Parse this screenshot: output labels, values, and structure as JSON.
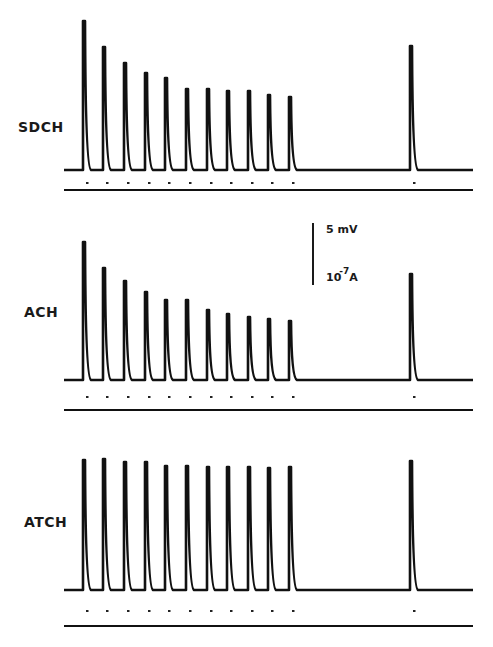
{
  "chart_data": {
    "type": "line",
    "title": "",
    "xlabel": "",
    "ylabel": "",
    "grid": false,
    "legend": "none",
    "scale_bar": {
      "voltage": "5 mV",
      "current_base": "10",
      "current_exp": "-7",
      "current_unit": "A"
    },
    "stimulus_x": [
      84,
      104,
      125,
      146,
      166,
      187,
      208,
      228,
      249,
      269,
      290
    ],
    "test_x": 411,
    "panels": [
      {
        "name": "SDCH",
        "baseline_y": 170,
        "marker_y": 182,
        "axis_y": 190,
        "spike_tops": [
          21,
          47,
          63,
          73,
          78,
          89,
          89,
          91,
          91,
          95,
          97
        ],
        "test_top": 46,
        "relative_amplitudes": [
          1.0,
          0.83,
          0.72,
          0.65,
          0.62,
          0.54,
          0.54,
          0.53,
          0.53,
          0.5,
          0.49
        ],
        "test_relative_amplitude": 0.83
      },
      {
        "name": "ACH",
        "baseline_y": 380,
        "marker_y": 396,
        "axis_y": 410,
        "spike_tops": [
          242,
          268,
          281,
          292,
          300,
          300,
          310,
          314,
          317,
          319,
          321
        ],
        "test_top": 274,
        "relative_amplitudes": [
          1.0,
          0.81,
          0.72,
          0.64,
          0.58,
          0.58,
          0.51,
          0.48,
          0.46,
          0.44,
          0.43
        ],
        "test_relative_amplitude": 0.77
      },
      {
        "name": "ATCH",
        "baseline_y": 590,
        "marker_y": 610,
        "axis_y": 626,
        "spike_tops": [
          460,
          459,
          462,
          462,
          466,
          466,
          467,
          467,
          467,
          468,
          467
        ],
        "test_top": 461,
        "relative_amplitudes": [
          1.0,
          1.01,
          0.98,
          0.98,
          0.95,
          0.95,
          0.95,
          0.95,
          0.95,
          0.94,
          0.95
        ],
        "test_relative_amplitude": 0.99
      }
    ]
  },
  "labels": {
    "panel1": "SDCH",
    "panel2": "ACH",
    "panel3": "ATCH",
    "scale_mv": "5 mV",
    "scale_a_base": "10",
    "scale_a_exp": "-7",
    "scale_a_unit": "A"
  }
}
